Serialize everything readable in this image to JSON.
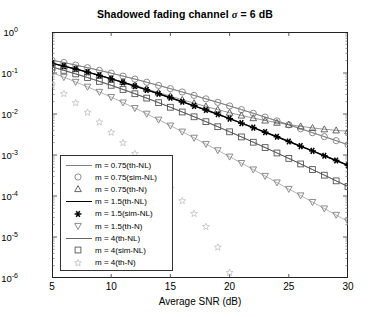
{
  "chart_data": {
    "type": "line",
    "title": "Shadowed fading channel σ = 6 dB",
    "title_prefix": "Shadowed fading channel ",
    "title_sigma": "σ",
    "title_suffix": " = 6 dB",
    "xlabel": "Average SNR (dB)",
    "ylabel": "Average probability of error",
    "xlim": [
      5,
      30
    ],
    "ylim": [
      1e-06,
      1
    ],
    "yscale": "log",
    "xticks": [
      5,
      10,
      15,
      20,
      25,
      30
    ],
    "yticks": [
      "10^0",
      "10^-1",
      "10^-2",
      "10^-3",
      "10^-4",
      "10^-5",
      "10^-6"
    ],
    "ytick_labels": [
      {
        "mant": "10",
        "exp": "0"
      },
      {
        "mant": "10",
        "exp": "-1"
      },
      {
        "mant": "10",
        "exp": "-2"
      },
      {
        "mant": "10",
        "exp": "-3"
      },
      {
        "mant": "10",
        "exp": "-4"
      },
      {
        "mant": "10",
        "exp": "-5"
      },
      {
        "mant": "10",
        "exp": "-6"
      }
    ],
    "grid": false,
    "legend_position": "lower-left",
    "series": [
      {
        "name": "m = 0.75(th-NL)",
        "style": "line",
        "marker": "none",
        "color": "#808080",
        "x": [
          5,
          6,
          7,
          8,
          9,
          10,
          11,
          12,
          13,
          14,
          15,
          16,
          17,
          18,
          19,
          20,
          21,
          22,
          23,
          24,
          25,
          26,
          27,
          28,
          29,
          30
        ],
        "y": [
          0.205,
          0.18,
          0.156,
          0.135,
          0.116,
          0.099,
          0.084,
          0.071,
          0.0595,
          0.0498,
          0.0415,
          0.0344,
          0.0284,
          0.0234,
          0.0192,
          0.0157,
          0.0128,
          0.0104,
          0.0084,
          0.0068,
          0.00545,
          0.00438,
          0.0035,
          0.0028,
          0.00224,
          0.00178
        ]
      },
      {
        "name": "m = 0.75(sim-NL)",
        "style": "marker",
        "marker": "circle",
        "color": "#808080",
        "x": [
          5,
          6,
          7,
          8,
          9,
          10,
          11,
          12,
          13,
          14,
          15,
          16,
          17,
          18,
          19,
          20,
          21,
          22,
          23,
          24,
          25,
          26,
          27,
          28,
          29,
          30
        ],
        "y": [
          0.205,
          0.18,
          0.156,
          0.135,
          0.116,
          0.099,
          0.084,
          0.071,
          0.0595,
          0.0498,
          0.0415,
          0.0344,
          0.0284,
          0.0234,
          0.0192,
          0.0157,
          0.0128,
          0.0104,
          0.0084,
          0.0068,
          0.00545,
          0.00438,
          0.0035,
          0.0028,
          0.00224,
          0.00178
        ]
      },
      {
        "name": "m = 0.75(th-N)",
        "style": "marker",
        "marker": "triangle-up",
        "color": "#555555",
        "x": [
          5,
          6,
          7,
          8,
          9,
          10,
          11,
          12,
          13,
          14,
          15,
          16,
          17,
          18,
          19,
          20,
          21,
          22,
          23,
          24,
          25,
          26,
          27,
          28,
          29,
          30
        ],
        "y": [
          0.172,
          0.147,
          0.125,
          0.105,
          0.088,
          0.073,
          0.0605,
          0.0498,
          0.0408,
          0.0333,
          0.0272,
          0.0223,
          0.0184,
          0.0153,
          0.0128,
          0.0108,
          0.0092,
          0.00795,
          0.00695,
          0.00615,
          0.0055,
          0.005,
          0.00458,
          0.00425,
          0.004,
          0.0038
        ]
      },
      {
        "name": "m = 1.5(th-NL)",
        "style": "line",
        "marker": "none",
        "color": "#000000",
        "x": [
          5,
          6,
          7,
          8,
          9,
          10,
          11,
          12,
          13,
          14,
          15,
          16,
          17,
          18,
          19,
          20,
          21,
          22,
          23,
          24,
          25,
          26,
          27,
          28,
          29,
          30
        ],
        "y": [
          0.172,
          0.147,
          0.125,
          0.105,
          0.0875,
          0.072,
          0.059,
          0.048,
          0.0388,
          0.0312,
          0.025,
          0.0199,
          0.0158,
          0.0125,
          0.00985,
          0.0077,
          0.006,
          0.00466,
          0.0036,
          0.00278,
          0.00214,
          0.00164,
          0.00126,
          0.00096,
          0.000735,
          0.00056
        ]
      },
      {
        "name": "m = 1.5(sim-NL)",
        "style": "marker",
        "marker": "asterisk",
        "color": "#000000",
        "x": [
          5,
          6,
          7,
          8,
          9,
          10,
          11,
          12,
          13,
          14,
          15,
          16,
          17,
          18,
          19,
          20,
          21,
          22,
          23,
          24,
          25,
          26,
          27,
          28,
          29,
          30
        ],
        "y": [
          0.172,
          0.147,
          0.125,
          0.105,
          0.0875,
          0.072,
          0.059,
          0.048,
          0.0388,
          0.0312,
          0.025,
          0.0199,
          0.0158,
          0.0125,
          0.00985,
          0.0077,
          0.006,
          0.00466,
          0.0036,
          0.00278,
          0.00214,
          0.00164,
          0.00126,
          0.00096,
          0.000735,
          0.00056
        ]
      },
      {
        "name": "m = 1.5(th-N)",
        "style": "marker",
        "marker": "triangle-down",
        "color": "#808080",
        "x": [
          5,
          6,
          7,
          8,
          9,
          10,
          11,
          12,
          13,
          14,
          15,
          16,
          17,
          18,
          19,
          20,
          21,
          22,
          23,
          24,
          25,
          26,
          27,
          28,
          29,
          30
        ],
        "y": [
          0.102,
          0.079,
          0.0605,
          0.046,
          0.0345,
          0.0258,
          0.019,
          0.0139,
          0.0101,
          0.00725,
          0.0052,
          0.0037,
          0.00262,
          0.00185,
          0.0013,
          0.00091,
          0.000635,
          0.000442,
          0.000307,
          0.000213,
          0.000148,
          0.000103,
          7.1e-05,
          4.95e-05,
          3.45e-05,
          2.4e-05
        ]
      },
      {
        "name": "m = 4(th-NL)",
        "style": "line",
        "marker": "none",
        "color": "#666666",
        "x": [
          5,
          6,
          7,
          8,
          9,
          10,
          11,
          12,
          13,
          14,
          15,
          16,
          17,
          18,
          19,
          20,
          21,
          22,
          23,
          24,
          25,
          26,
          27,
          28,
          29,
          30
        ],
        "y": [
          0.14,
          0.116,
          0.095,
          0.0775,
          0.0625,
          0.05,
          0.0396,
          0.0312,
          0.0244,
          0.0189,
          0.0146,
          0.0112,
          0.00855,
          0.0065,
          0.0049,
          0.00368,
          0.00276,
          0.00205,
          0.00152,
          0.00112,
          0.000825,
          0.000605,
          0.000442,
          0.000322,
          0.000234,
          0.00017
        ]
      },
      {
        "name": "m = 4(sim-NL)",
        "style": "marker",
        "marker": "square",
        "color": "#555555",
        "x": [
          5,
          6,
          7,
          8,
          9,
          10,
          11,
          12,
          13,
          14,
          15,
          16,
          17,
          18,
          19,
          20,
          21,
          22,
          23,
          24,
          25,
          26,
          27,
          28,
          29,
          30
        ],
        "y": [
          0.14,
          0.116,
          0.095,
          0.0775,
          0.0625,
          0.05,
          0.0396,
          0.0312,
          0.0244,
          0.0189,
          0.0146,
          0.0112,
          0.00855,
          0.0065,
          0.0049,
          0.00368,
          0.00276,
          0.00205,
          0.00152,
          0.00112,
          0.000825,
          0.000605,
          0.000442,
          0.000322,
          0.000234,
          0.00017
        ]
      },
      {
        "name": "m = 4(th-N)",
        "style": "marker",
        "marker": "star",
        "color": "#c0c0c0",
        "x": [
          5,
          6,
          7,
          8,
          9,
          10,
          11,
          12,
          13,
          14,
          15,
          16,
          17,
          18,
          19,
          20
        ],
        "y": [
          0.051,
          0.031,
          0.0186,
          0.0109,
          0.0063,
          0.00355,
          0.00197,
          0.00107,
          0.00057,
          0.000297,
          0.000152,
          7.6e-05,
          3.7e-05,
          1.78e-05,
          5.6e-06,
          1.35e-06
        ]
      }
    ]
  },
  "legend": {
    "items": [
      {
        "label": "m = 0.75(th-NL)",
        "key": "line-grey"
      },
      {
        "label": "m = 0.75(sim-NL)",
        "key": "circle"
      },
      {
        "label": "m = 0.75(th-N)",
        "key": "triangle-up"
      },
      {
        "label": "m = 1.5(th-NL)",
        "key": "line-black"
      },
      {
        "label": "m = 1.5(sim-NL)",
        "key": "asterisk"
      },
      {
        "label": "m = 1.5(th-N)",
        "key": "triangle-down"
      },
      {
        "label": "m = 4(th-NL)",
        "key": "line-dark"
      },
      {
        "label": "m = 4(sim-NL)",
        "key": "square"
      },
      {
        "label": "m = 4(th-N)",
        "key": "star"
      }
    ]
  }
}
